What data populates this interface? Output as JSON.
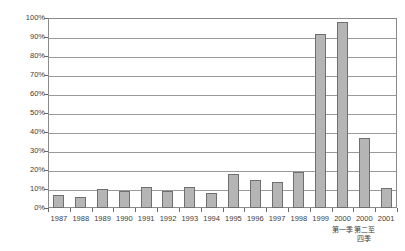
{
  "chart_data": {
    "type": "bar",
    "title": "",
    "subtitle": "",
    "xlabel": "",
    "ylabel": "",
    "ylim": [
      0,
      100
    ],
    "ytick_labels": [
      "100%",
      "90%",
      "80%",
      "70%",
      "60%",
      "50%",
      "40%",
      "30%",
      "20%",
      "10%",
      "0%"
    ],
    "ytick_values": [
      100,
      90,
      80,
      70,
      60,
      50,
      40,
      30,
      20,
      10,
      0
    ],
    "grid": "horizontal",
    "legend": "none",
    "categories": [
      "1987",
      "1988",
      "1989",
      "1990",
      "1991",
      "1992",
      "1993",
      "1994",
      "1995",
      "1996",
      "1997",
      "1998",
      "1999",
      "2000",
      "2000",
      "2001"
    ],
    "category_sublabels": [
      "",
      "",
      "",
      "",
      "",
      "",
      "",
      "",
      "",
      "",
      "",
      "",
      "",
      "第一季",
      "第二至\n四季",
      ""
    ],
    "values": [
      7,
      6,
      10,
      9,
      11,
      9,
      11,
      8,
      18,
      15,
      13.5,
      19,
      91.5,
      98,
      37,
      10.5
    ],
    "series": [
      {
        "name": "",
        "values": [
          7,
          6,
          10,
          9,
          11,
          9,
          11,
          8,
          18,
          15,
          13.5,
          19,
          91.5,
          98,
          37,
          10.5
        ]
      }
    ]
  },
  "style": {
    "bar_fill": "#b5b5b5",
    "bar_stroke": "#6f6f6f",
    "gridline_color": "#9a9a9a",
    "axis_color": "#8a8a8a",
    "text_color": "#3d3d3d",
    "background": "#ffffff"
  }
}
